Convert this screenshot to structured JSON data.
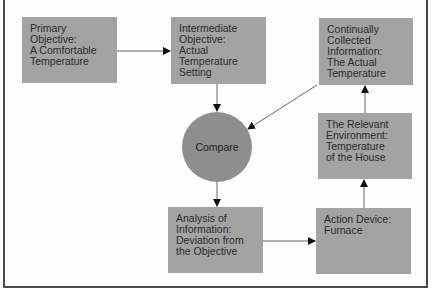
{
  "diagram": {
    "nodes": [
      {
        "id": "primary",
        "label": "Primary Objective: A Comfortable Temperature",
        "lines": [
          "Primary",
          "Objective:",
          "A Comfortable",
          "Temperature"
        ]
      },
      {
        "id": "intermediate",
        "label": "Intermediate Objective: Actual Temperature Setting",
        "lines": [
          "Intermediate",
          "Objective:",
          "Actual",
          "Temperature",
          "Setting"
        ]
      },
      {
        "id": "collected",
        "label": "Continually Collected Information: The Actual Temperature",
        "lines": [
          "Continually",
          "Collected",
          "Information:",
          "The Actual",
          "Temperature"
        ]
      },
      {
        "id": "environment",
        "label": "The Relevant Environment: Temperature of the House",
        "lines": [
          "The Relevant",
          "Environment:",
          "Temperature",
          "of the House"
        ]
      },
      {
        "id": "compare",
        "label": "Compare",
        "lines": [
          "Compare"
        ]
      },
      {
        "id": "analysis",
        "label": "Analysis of Information: Deviation from the Objective",
        "lines": [
          "Analysis of",
          "Information:",
          "Deviation from",
          "the Objective"
        ]
      },
      {
        "id": "action",
        "label": "Action Device: Furnace",
        "lines": [
          "Action Device:",
          "Furnace"
        ]
      }
    ],
    "edges": [
      {
        "from": "primary",
        "to": "intermediate"
      },
      {
        "from": "intermediate",
        "to": "compare"
      },
      {
        "from": "collected",
        "to": "compare"
      },
      {
        "from": "compare",
        "to": "analysis"
      },
      {
        "from": "analysis",
        "to": "action"
      },
      {
        "from": "action",
        "to": "environment"
      },
      {
        "from": "environment",
        "to": "collected"
      }
    ],
    "colors": {
      "box": "#a3a3a3",
      "circle": "#8e8e8e",
      "arrow": "#555555",
      "arrowhead": "#111111",
      "border": "#4a4a4a"
    }
  }
}
